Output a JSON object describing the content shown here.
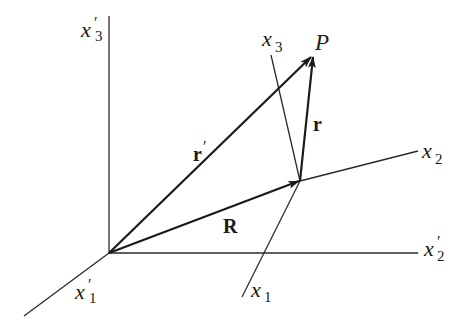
{
  "figure": {
    "colors": {
      "background": "#ffffff",
      "ink": "#1a1a1a"
    }
  },
  "labels": {
    "x3_prime": {
      "base": "x",
      "sub": "3",
      "prime": "′"
    },
    "x2_prime": {
      "base": "x",
      "sub": "2",
      "prime": "′"
    },
    "x1_prime": {
      "base": "x",
      "sub": "1",
      "prime": "′"
    },
    "x3": {
      "base": "x",
      "sub": "3"
    },
    "x2": {
      "base": "x",
      "sub": "2"
    },
    "x1": {
      "base": "x",
      "sub": "1"
    },
    "point_P": "P",
    "vec_r_prime": {
      "base": "r",
      "prime": "′"
    },
    "vec_r": "r",
    "vec_R": "R"
  }
}
